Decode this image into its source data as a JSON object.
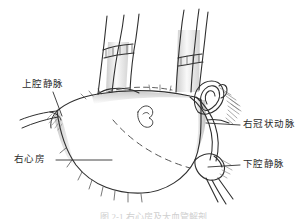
{
  "figure": {
    "kind": "anatomical-line-drawing",
    "background_color": "#ffffff",
    "ink_color": "#2b2b2b",
    "shading_color": "#8a8a8a",
    "labels": [
      {
        "id": "svc",
        "text": "上腔静脉",
        "position": "upper-left",
        "leader": "diagonal-down-right"
      },
      {
        "id": "ra",
        "text": "右心房",
        "position": "lower-left",
        "leader": "horizontal-right"
      },
      {
        "id": "rca",
        "text": "右冠状动脉",
        "position": "middle-right",
        "leader": "horizontal-left"
      },
      {
        "id": "ivc",
        "text": "下腔静脉",
        "position": "lower-right",
        "leader": "horizontal-left"
      }
    ],
    "caption": "图 2-1  右心房及大血管解剖",
    "caption_visible": "cropped"
  }
}
